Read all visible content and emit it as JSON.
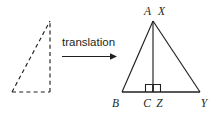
{
  "figure": {
    "background_color": "#ffffff",
    "stroke_color": "#231f20",
    "width": 221,
    "height": 115
  },
  "transformation": {
    "label": "translation",
    "arrow_direction": "right"
  },
  "preimage": {
    "name": "preimage-triangle",
    "line_style": "dashed",
    "vertices": [
      {
        "x": 12,
        "y": 92
      },
      {
        "x": 50,
        "y": 92
      },
      {
        "x": 50,
        "y": 21
      }
    ]
  },
  "image": {
    "name": "image-triangle",
    "line_style": "solid",
    "vertices": [
      {
        "x": 122,
        "y": 92
      },
      {
        "x": 200,
        "y": 92
      },
      {
        "x": 153,
        "y": 21
      }
    ],
    "altitude": {
      "from_x": 153,
      "from_y": 21,
      "to_x": 153,
      "to_y": 92
    },
    "right_angle_marks": 2
  },
  "labels": {
    "apex": "A X",
    "apex_left": "A",
    "apex_right": "X",
    "bottom_left": "B",
    "foot": "C Z",
    "foot_left": "C",
    "foot_right": "Z",
    "bottom_right": "Y"
  }
}
